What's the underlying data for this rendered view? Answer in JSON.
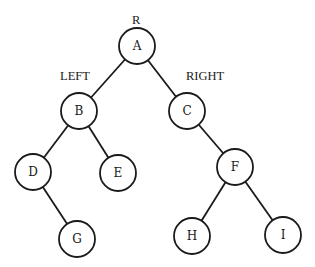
{
  "diagram": {
    "type": "binary-tree",
    "annotations": {
      "root": "R",
      "left": "LEFT",
      "right": "RIGHT"
    },
    "nodes": [
      {
        "id": "A",
        "label": "A",
        "x": 137,
        "y": 46
      },
      {
        "id": "B",
        "label": "B",
        "x": 79,
        "y": 111
      },
      {
        "id": "C",
        "label": "C",
        "x": 187,
        "y": 111
      },
      {
        "id": "D",
        "label": "D",
        "x": 33,
        "y": 172
      },
      {
        "id": "E",
        "label": "E",
        "x": 118,
        "y": 173
      },
      {
        "id": "F",
        "label": "F",
        "x": 235,
        "y": 167
      },
      {
        "id": "G",
        "label": "G",
        "x": 77,
        "y": 239
      },
      {
        "id": "H",
        "label": "H",
        "x": 192,
        "y": 236
      },
      {
        "id": "I",
        "label": "I",
        "x": 283,
        "y": 235
      }
    ],
    "edges": [
      {
        "from": "A",
        "to": "B"
      },
      {
        "from": "A",
        "to": "C"
      },
      {
        "from": "B",
        "to": "D"
      },
      {
        "from": "B",
        "to": "E"
      },
      {
        "from": "C",
        "to": "F"
      },
      {
        "from": "D",
        "to": "G"
      },
      {
        "from": "F",
        "to": "H"
      },
      {
        "from": "F",
        "to": "I"
      }
    ],
    "node_radius": 18,
    "colors": {
      "stroke": "#1a1a1a",
      "fill": "#ffffff",
      "background": "#ffffff"
    }
  }
}
